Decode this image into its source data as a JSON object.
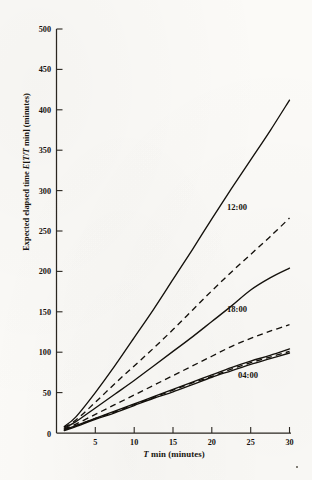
{
  "figure": {
    "background_color": "#fbfaf7",
    "ink_color": "#14110c"
  },
  "axis": {
    "y_title_parts": {
      "pre": "Expected elapsed time ",
      "italic_e": "E",
      "bracket_open": "[",
      "italic_t1": "T",
      "slash": "/",
      "italic_t2": "T",
      "min": " min",
      "bracket_close": "]",
      "units": " (minutes)"
    },
    "y_title_plain": "Expected elapsed time E[T/T min] (minutes)",
    "x_title_parts": {
      "italic_t": "T",
      "min": " min",
      "units": "  (minutes)"
    },
    "x_title_plain": "T min (minutes)"
  },
  "chart_data": {
    "type": "line",
    "title": "",
    "subtitle": "",
    "xlabel": "T min (minutes)",
    "ylabel": "Expected elapsed time E[T/T min] (minutes)",
    "xlim": [
      0,
      30
    ],
    "ylim": [
      0,
      500
    ],
    "xticks": [
      0,
      5,
      10,
      15,
      20,
      25,
      30
    ],
    "yticks": [
      0,
      50,
      100,
      150,
      200,
      250,
      300,
      350,
      400,
      450,
      500
    ],
    "xtick_labels": [
      "0",
      "5",
      "10",
      "15",
      "20",
      "25",
      "30"
    ],
    "ytick_labels": [
      "0",
      "50",
      "100",
      "150",
      "200",
      "250",
      "300",
      "350",
      "400",
      "450",
      "500"
    ],
    "grid": false,
    "legend": "inline-annotations",
    "annotations": [
      {
        "text": "12:00",
        "x": 22.0,
        "y": 233
      },
      {
        "text": "18:00",
        "x": 22.0,
        "y": 158
      },
      {
        "text": "04:00",
        "x": 23.0,
        "y": 88
      },
      {
        "text": "0",
        "x": 0,
        "y": 0
      }
    ],
    "series": [
      {
        "name": "12:00 solid",
        "label": "12:00",
        "style": "solid",
        "x": [
          1,
          2.5,
          5,
          7.5,
          10,
          12.5,
          15,
          17.5,
          20,
          22.5,
          25,
          27.5,
          30
        ],
        "y": [
          8,
          20,
          50,
          83,
          118,
          153,
          190,
          227,
          265,
          302,
          338,
          374,
          412
        ]
      },
      {
        "name": "12:00 dashed",
        "label": "12:00",
        "style": "dashed",
        "x": [
          1,
          2.5,
          5,
          7.5,
          10,
          12.5,
          15,
          17.5,
          20,
          22.5,
          25,
          27.5,
          30
        ],
        "y": [
          7,
          16,
          38,
          61,
          83,
          105,
          128,
          152,
          176,
          199,
          221,
          243,
          266
        ]
      },
      {
        "name": "18:00 solid",
        "label": "18:00",
        "style": "solid",
        "x": [
          1,
          2.5,
          5,
          7.5,
          10,
          12.5,
          15,
          17.5,
          20,
          22.5,
          25,
          27.5,
          30
        ],
        "y": [
          6,
          14,
          31,
          48,
          65,
          83,
          101,
          119,
          138,
          157,
          177,
          192,
          204
        ]
      },
      {
        "name": "18:00 dashed",
        "label": "18:00",
        "style": "dashed",
        "x": [
          1,
          2.5,
          5,
          7.5,
          10,
          12.5,
          15,
          17.5,
          20,
          22.5,
          25,
          27.5,
          30
        ],
        "y": [
          5,
          11,
          23,
          35,
          47,
          59,
          71,
          83,
          95,
          107,
          117,
          126,
          134
        ]
      },
      {
        "name": "04:00 solid-upper",
        "label": "04:00",
        "style": "solid",
        "x": [
          1,
          2.5,
          5,
          7.5,
          10,
          12.5,
          15,
          17.5,
          20,
          22.5,
          25,
          27.5,
          30
        ],
        "y": [
          4,
          9,
          18,
          27,
          36,
          45,
          54,
          63,
          72,
          81,
          89,
          96,
          104
        ]
      },
      {
        "name": "04:00 dashed",
        "label": "04:00",
        "style": "dashed",
        "x": [
          1,
          2.5,
          5,
          7.5,
          10,
          12.5,
          15,
          17.5,
          20,
          22.5,
          25,
          27.5,
          30
        ],
        "y": [
          4,
          9,
          18,
          26,
          35,
          44,
          53,
          62,
          70,
          79,
          87,
          94,
          101
        ]
      },
      {
        "name": "04:00 solid-lower",
        "label": "04:00",
        "style": "solid",
        "x": [
          1,
          2.5,
          5,
          7.5,
          10,
          12.5,
          15,
          17.5,
          20,
          22.5,
          25,
          27.5,
          30
        ],
        "y": [
          3,
          8,
          17,
          25,
          34,
          43,
          51,
          60,
          69,
          77,
          85,
          92,
          99
        ]
      }
    ]
  }
}
